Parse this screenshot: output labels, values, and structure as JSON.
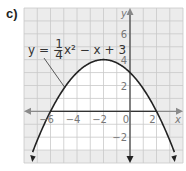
{
  "panel_label": "c)",
  "chart_data": {
    "type": "line",
    "title": "",
    "equation_label": {
      "lhs": "y = −",
      "num": "1",
      "den": "4",
      "rhs": "x² − x + 3"
    },
    "function": "y = -1/4 x^2 - x + 3",
    "xlabel": "x",
    "ylabel": "y",
    "xlim": [
      -8,
      4
    ],
    "ylim": [
      -4,
      8
    ],
    "grid": true,
    "x_ticks": [
      -6,
      -4,
      -2,
      0,
      2
    ],
    "y_ticks": [
      6,
      4,
      2,
      -2
    ],
    "x_tick_labels": [
      "−6",
      "−4",
      "−2",
      "0",
      "2"
    ],
    "y_tick_labels": [
      "6",
      "4",
      "2",
      "−2"
    ],
    "key_points": {
      "vertex": [
        -2,
        4
      ],
      "y_intercept": [
        0,
        3
      ],
      "x_intercepts": [
        -6,
        2
      ]
    },
    "horizontal_segment": {
      "y": 0,
      "x_from": -6,
      "x_to": 2
    },
    "colors": {
      "grid_bg": "#ececec",
      "grid_line": "#c9c9c9",
      "axis_x": "#8a8a8a",
      "axis_y": "#555555",
      "curve": "#222222",
      "inside": "#ffffff"
    }
  }
}
